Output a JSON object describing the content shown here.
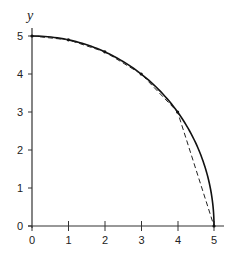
{
  "chart_data": {
    "type": "line",
    "title": "",
    "xlabel": "",
    "ylabel": "y",
    "xlim": [
      0,
      5
    ],
    "ylim": [
      0,
      5
    ],
    "grid": false,
    "x_ticks": [
      "0",
      "1",
      "2",
      "3",
      "4",
      "5"
    ],
    "y_ticks": [
      "0",
      "1",
      "2",
      "3",
      "4",
      "5"
    ],
    "series": [
      {
        "name": "quarter circle x^2 + y^2 = 25",
        "style": "solid",
        "x": [
          0,
          0.5,
          1,
          1.5,
          2,
          2.5,
          3,
          3.5,
          4,
          4.5,
          4.8,
          4.95,
          5
        ],
        "values": [
          5,
          4.975,
          4.899,
          4.77,
          4.583,
          4.33,
          4,
          3.571,
          3,
          2.179,
          1.4,
          0.705,
          0
        ]
      },
      {
        "name": "polygonal approximation",
        "style": "dashed",
        "x": [
          0,
          1,
          2,
          3,
          4,
          5
        ],
        "values": [
          5,
          4.899,
          4.583,
          4,
          3,
          0
        ]
      }
    ]
  },
  "axes": {
    "y_label": "y",
    "x_ticks": [
      "0",
      "1",
      "2",
      "3",
      "4",
      "5"
    ],
    "y_ticks": [
      "0",
      "1",
      "2",
      "3",
      "4",
      "5"
    ]
  }
}
